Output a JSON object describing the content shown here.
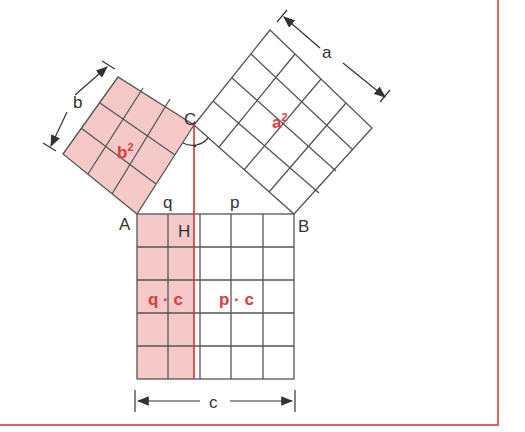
{
  "diagram": {
    "type": "pythagorean-theorem / Euclid's leg theorem",
    "vertices": {
      "A": "A",
      "B": "B",
      "C": "C",
      "H": "H"
    },
    "sides": {
      "a": "a",
      "b": "b",
      "c": "c",
      "p": "p",
      "q": "q"
    },
    "areas": {
      "a_sq": "a",
      "b_sq": "b",
      "exp": "2",
      "qc": "q · c",
      "pc": "p · c"
    },
    "grids": {
      "b_square": 3,
      "a_square": 4,
      "c_square": 5
    },
    "colors": {
      "accent": "#e03a3a",
      "fill": "#f6c9c9",
      "line": "#444444",
      "frame": "#e06060"
    }
  }
}
